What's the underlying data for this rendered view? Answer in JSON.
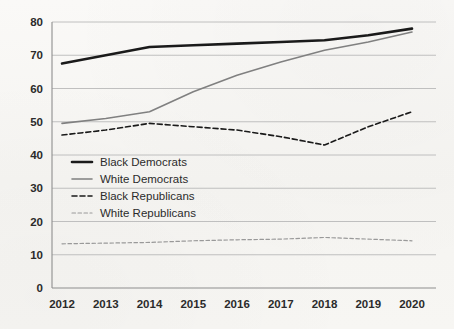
{
  "chart_data": {
    "type": "line",
    "title": "",
    "subtitle": "",
    "xlabel": "",
    "ylabel": "",
    "categories": [
      "2012",
      "2013",
      "2014",
      "2015",
      "2016",
      "2017",
      "2018",
      "2019",
      "2020"
    ],
    "x": [
      2012,
      2013,
      2014,
      2015,
      2016,
      2017,
      2018,
      2019,
      2020
    ],
    "ylim": [
      0,
      80
    ],
    "ytick_labels": [
      "0",
      "10",
      "20",
      "30",
      "40",
      "50",
      "60",
      "70",
      "80"
    ],
    "yticks": [
      0,
      10,
      20,
      30,
      40,
      50,
      60,
      70,
      80
    ],
    "grid": "horizontal",
    "legend_position": "inside-left",
    "series": [
      {
        "name": "Black Democrats",
        "values": [
          67.5,
          70.0,
          72.5,
          73.0,
          73.5,
          74.0,
          74.5,
          76.0,
          78.0
        ],
        "color": "#1a1a1a",
        "style": "solid",
        "width": 2.6
      },
      {
        "name": "White Democrats",
        "values": [
          49.5,
          51.0,
          53.0,
          59.0,
          64.0,
          68.0,
          71.5,
          74.0,
          77.0
        ],
        "color": "#808080",
        "style": "solid",
        "width": 1.6
      },
      {
        "name": "Black Republicans",
        "values": [
          46.0,
          47.5,
          49.5,
          48.5,
          47.5,
          45.5,
          43.0,
          48.5,
          53.0
        ],
        "color": "#1a1a1a",
        "style": "dashed",
        "width": 1.6
      },
      {
        "name": "White Republicans",
        "values": [
          13.3,
          13.5,
          13.7,
          14.2,
          14.5,
          14.7,
          15.2,
          14.7,
          14.2
        ],
        "color": "#999999",
        "style": "dashed",
        "width": 1.2
      }
    ]
  },
  "legend": {
    "entries": [
      {
        "label": "Black Democrats"
      },
      {
        "label": "White Democrats"
      },
      {
        "label": "Black Republicans"
      },
      {
        "label": "White Republicans"
      }
    ]
  },
  "colors": {
    "background": "#f7f6f4",
    "gridline": "#b9b9b9",
    "axis": "#8e8e8e",
    "text": "#2b2b2b",
    "black_series": "#1a1a1a",
    "gray_series": "#808080",
    "light_gray_series": "#999999"
  }
}
